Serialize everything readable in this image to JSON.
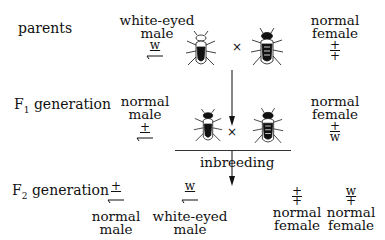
{
  "rows": {
    "parents": {
      "label": "parents"
    },
    "f1": {
      "label_main": "F",
      "label_sub": "1",
      "label_rest": " generation"
    },
    "f2": {
      "label_main": "F",
      "label_sub": "2",
      "label_rest": " generation"
    }
  },
  "parents": {
    "male": {
      "line1": "white-eyed",
      "line2": "male",
      "genotype_top": "w",
      "genotype_bottom": "Y-chromosome"
    },
    "female": {
      "line1": "normal",
      "line2": "female",
      "genotype_top": "+",
      "genotype_bottom": "+"
    },
    "cross": "×"
  },
  "f1": {
    "male": {
      "line1": "normal",
      "line2": "male",
      "genotype_top": "+"
    },
    "female": {
      "line1": "normal",
      "line2": "female",
      "genotype_top": "+",
      "genotype_bottom": "w"
    },
    "cross": "×"
  },
  "inbreeding": "inbreeding",
  "f2": [
    {
      "genotype_top": "+",
      "line1": "normal",
      "line2": "male"
    },
    {
      "genotype_top": "w",
      "line1": "white-eyed",
      "line2": "male"
    },
    {
      "genotype_top": "+",
      "genotype_bottom": "+",
      "line1": "normal",
      "line2": "female"
    },
    {
      "genotype_top": "w",
      "genotype_bottom": "+",
      "line1": "normal",
      "line2": "female"
    }
  ]
}
